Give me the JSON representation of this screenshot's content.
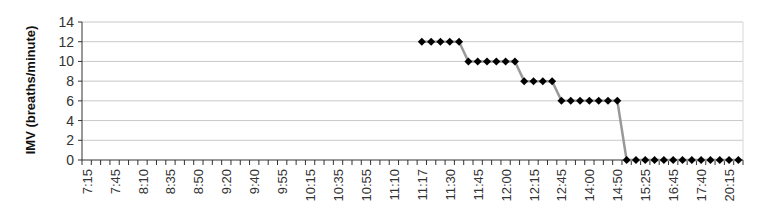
{
  "chart_data": {
    "type": "line",
    "title": "",
    "xlabel": "",
    "ylabel": "IMV (breaths/minute)",
    "ylim": [
      0,
      14
    ],
    "yticks": [
      0,
      2,
      4,
      6,
      8,
      10,
      12,
      14
    ],
    "grid": true,
    "legend": null,
    "x_tick_labels_every": 3,
    "x_tick_labels": [
      "7:15",
      "7:45",
      "8:10",
      "8:35",
      "8:50",
      "9:20",
      "9:40",
      "9:55",
      "10:15",
      "10:35",
      "10:55",
      "11:10",
      "11:17",
      "11:30",
      "11:45",
      "12:00",
      "12:15",
      "12:45",
      "14:00",
      "14:50",
      "15:25",
      "16:45",
      "17:40",
      "20:15"
    ],
    "n_categories": 71,
    "series": [
      {
        "name": "IMV",
        "color": "#999999",
        "marker": "diamond",
        "marker_color": "#000000",
        "start_index": 36,
        "values": [
          12,
          12,
          12,
          12,
          12,
          10,
          10,
          10,
          10,
          10,
          10,
          8,
          8,
          8,
          8,
          6,
          6,
          6,
          6,
          6,
          6,
          6,
          0,
          0,
          0,
          0,
          0,
          0,
          0,
          0,
          0,
          0,
          0,
          0,
          0
        ]
      }
    ]
  }
}
